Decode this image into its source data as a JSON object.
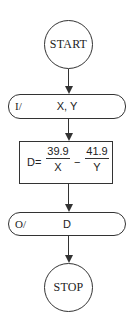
{
  "flowchart": {
    "start": {
      "label": "START"
    },
    "input": {
      "tag": "I/",
      "value": "X, Y"
    },
    "process": {
      "lhs": "D=",
      "term1": {
        "numerator": "39.9",
        "denominator": "X"
      },
      "operator": "−",
      "term2": {
        "numerator": "41.9",
        "denominator": "Y"
      }
    },
    "output": {
      "tag": "O/",
      "value": "D"
    },
    "stop": {
      "label": "STOP"
    }
  }
}
